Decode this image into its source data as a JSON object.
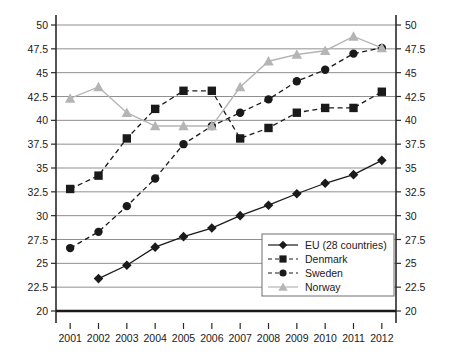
{
  "chart_data": {
    "type": "line",
    "title": "",
    "subtitle": "",
    "xlabel": "",
    "ylabel": "",
    "categories": [
      "2001",
      "2002",
      "2003",
      "2004",
      "2005",
      "2006",
      "2007",
      "2008",
      "2009",
      "2010",
      "2011",
      "2012"
    ],
    "x": [
      2001,
      2002,
      2003,
      2004,
      2005,
      2006,
      2007,
      2008,
      2009,
      2010,
      2011,
      2012
    ],
    "ylim": [
      20,
      50
    ],
    "y_ticks": [
      20,
      22.5,
      25,
      27.5,
      30,
      32.5,
      35,
      37.5,
      40,
      42.5,
      45,
      47.5,
      50
    ],
    "y_tick_labels": [
      "20",
      "22.5",
      "25",
      "27.5",
      "30",
      "32.5",
      "35",
      "37.5",
      "40",
      "42.5",
      "45",
      "47.5",
      "50"
    ],
    "grid": true,
    "grid_axis": "y",
    "legend_position": "lower right",
    "dual_y_axis": true,
    "series": [
      {
        "name": "EU (28 countries)",
        "marker": "diamond",
        "line_style": "solid",
        "color": "#1a1a1a",
        "values": [
          null,
          23.4,
          24.8,
          26.7,
          27.8,
          28.7,
          30.0,
          31.1,
          32.3,
          33.4,
          34.3,
          35.8
        ]
      },
      {
        "name": "Denmark",
        "marker": "square",
        "line_style": "dashed",
        "color": "#1a1a1a",
        "values": [
          32.8,
          34.2,
          38.1,
          41.2,
          43.1,
          43.1,
          38.1,
          39.2,
          40.8,
          41.3,
          41.3,
          43.0
        ]
      },
      {
        "name": "Sweden",
        "marker": "circle",
        "line_style": "dashed",
        "color": "#1a1a1a",
        "values": [
          26.6,
          28.3,
          31.0,
          33.9,
          37.5,
          39.4,
          40.8,
          42.2,
          44.1,
          45.3,
          47.0,
          47.6
        ]
      },
      {
        "name": "Norway",
        "marker": "triangle",
        "line_style": "solid-light",
        "color": "#b5b5b5",
        "values": [
          42.3,
          43.5,
          40.8,
          39.4,
          39.4,
          39.4,
          43.5,
          46.2,
          46.9,
          47.3,
          48.8,
          47.6
        ]
      }
    ],
    "legend": [
      {
        "label": "EU (28 countries)",
        "marker": "diamond",
        "line_style": "solid"
      },
      {
        "label": "Denmark",
        "marker": "square",
        "line_style": "dashed"
      },
      {
        "label": "Sweden",
        "marker": "circle",
        "line_style": "dashed"
      },
      {
        "label": "Norway",
        "marker": "triangle",
        "line_style": "solid-light"
      }
    ],
    "colors": {
      "axis": "#2a2a2a",
      "grid": "#8f8f8f",
      "baseline": "#1a1a1a",
      "series_dark": "#1a1a1a",
      "series_light": "#b5b5b5",
      "background": "#ffffff"
    }
  }
}
